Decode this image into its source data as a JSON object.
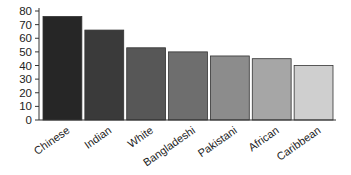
{
  "chart_data": {
    "type": "bar",
    "title": "",
    "xlabel": "",
    "ylabel": "",
    "categories": [
      "Chinese",
      "Indian",
      "White",
      "Bangladeshi",
      "Pakistani",
      "African",
      "Caribbean"
    ],
    "values": [
      76,
      66,
      53,
      50,
      47,
      45,
      40
    ],
    "colors": [
      "#262626",
      "#3a3a3a",
      "#575757",
      "#6e6e6e",
      "#8c8c8c",
      "#a6a6a6",
      "#cfcfcf"
    ],
    "ylim": [
      0,
      80
    ],
    "yticks": [
      0,
      10,
      20,
      30,
      40,
      50,
      60,
      70,
      80
    ],
    "grid": false,
    "legend": null
  }
}
